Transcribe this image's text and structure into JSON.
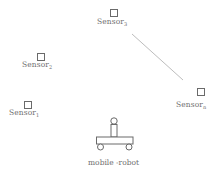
{
  "diagram": {
    "type": "sensor-network-with-mobile-robot",
    "colors": {
      "stroke": "#6a6a6a",
      "line": "#bdbdbd",
      "text": "#6f6f6f",
      "background": "#ffffff"
    },
    "sensors": [
      {
        "id": "sensor-3",
        "base": "Sensor",
        "sub": "3",
        "box": {
          "x": 110,
          "y": 9
        },
        "label_pos": {
          "x": 97,
          "y": 18
        }
      },
      {
        "id": "sensor-2",
        "base": "Sensor",
        "sub": "2",
        "box": {
          "x": 37,
          "y": 53
        },
        "label_pos": {
          "x": 22,
          "y": 61
        }
      },
      {
        "id": "sensor-1",
        "base": "Sensor",
        "sub": "1",
        "box": {
          "x": 24,
          "y": 101
        },
        "label_pos": {
          "x": 9,
          "y": 109
        }
      },
      {
        "id": "sensor-n",
        "base": "Sensor",
        "sub": "n",
        "box": {
          "x": 197,
          "y": 88
        },
        "label_pos": {
          "x": 176,
          "y": 101
        }
      }
    ],
    "connection": {
      "from": "sensor-3",
      "to": "sensor-n",
      "x1": 132,
      "y1": 34,
      "x2": 183,
      "y2": 80
    },
    "robot": {
      "label": "mobile -robot",
      "label_pos": {
        "x": 88,
        "y": 159
      }
    }
  }
}
